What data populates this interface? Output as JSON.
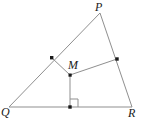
{
  "figure": {
    "width": 145,
    "height": 124,
    "background_color": "#ffffff",
    "stroke_color": "#8a8a8a",
    "marker_color": "#1a1a1a",
    "label_color": "#1a1a1a"
  },
  "labels": {
    "p": "P",
    "q": "Q",
    "r": "R",
    "m": "M"
  },
  "label_positions": {
    "p": {
      "x": 95,
      "y": 1
    },
    "q": {
      "x": 1,
      "y": 106
    },
    "r": {
      "x": 128,
      "y": 107
    },
    "m": {
      "x": 68,
      "y": 59
    }
  },
  "geometry": {
    "type": "euclidean-diagram",
    "vertices": [
      {
        "name": "P",
        "x": 100,
        "y": 13
      },
      {
        "name": "Q",
        "x": 9,
        "y": 107
      },
      {
        "name": "R",
        "x": 132,
        "y": 107
      }
    ],
    "interior_points": [
      {
        "name": "M",
        "x": 70,
        "y": 75,
        "labeled": true,
        "dot": false
      }
    ],
    "marked_points": [
      {
        "name": "midpoint-QP",
        "x": 52,
        "y": 58,
        "on_segment": "QP",
        "dot": true
      },
      {
        "name": "midpoint-PR",
        "x": 117,
        "y": 59,
        "on_segment": "PR",
        "dot": true
      },
      {
        "name": "foot-of-perpendicular",
        "x": 70,
        "y": 107,
        "on_segment": "QR",
        "dot": true
      }
    ],
    "triangle_edges": [
      {
        "name": "side-QP",
        "from": "Q",
        "to": "P"
      },
      {
        "name": "side-PR",
        "from": "P",
        "to": "R"
      },
      {
        "name": "side-QR",
        "from": "Q",
        "to": "R"
      }
    ],
    "cevian_segments": [
      {
        "name": "segment-M-to-midpoint-QP",
        "x1": 70,
        "y1": 75,
        "x2": 52,
        "y2": 58
      },
      {
        "name": "segment-M-to-midpoint-PR",
        "x1": 70,
        "y1": 75,
        "x2": 117,
        "y2": 59
      },
      {
        "name": "segment-M-to-foot",
        "x1": 70,
        "y1": 75,
        "x2": 70,
        "y2": 107
      }
    ],
    "right_angle": {
      "name": "right-angle-at-foot",
      "vertex_x": 70,
      "vertex_y": 107,
      "size": 8,
      "opens": "up-right",
      "measure": "90"
    }
  }
}
